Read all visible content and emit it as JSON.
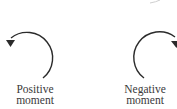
{
  "diagrams": [
    {
      "id": "positive",
      "direction": "counterclockwise",
      "label_line1": "Positive",
      "label_line2": "moment"
    },
    {
      "id": "negative",
      "direction": "clockwise",
      "label_line1": "Negative",
      "label_line2": "moment"
    }
  ],
  "colors": {
    "stroke": "#2b2b2b",
    "text": "#3a3a3a"
  }
}
